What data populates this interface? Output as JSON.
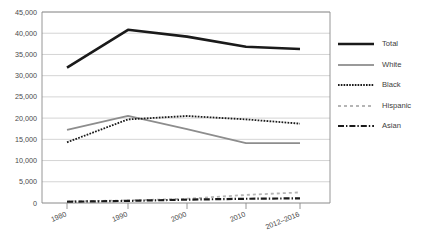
{
  "chart_data": {
    "type": "line",
    "title": "",
    "xlabel": "",
    "ylabel": "",
    "x": [
      "1980",
      "1990",
      "2000",
      "2010",
      "2012–2016"
    ],
    "categories": [
      "1980",
      "1990",
      "2000",
      "2010",
      "2012–2016"
    ],
    "ylim": [
      0,
      45000
    ],
    "ytick_values": [
      0,
      5000,
      10000,
      15000,
      20000,
      25000,
      30000,
      35000,
      40000,
      45000
    ],
    "ytick_labels": [
      "0",
      "5,000",
      "10,000",
      "15,000",
      "20,000",
      "25,000",
      "30,000",
      "35,000",
      "40,000",
      "45,000"
    ],
    "grid": "horizontal",
    "legend_position": "right",
    "series": [
      {
        "name": "Total",
        "values": [
          31900,
          40800,
          39200,
          36800,
          36300
        ],
        "color": "#1a1a1a",
        "style": "solid",
        "width": 2.6
      },
      {
        "name": "White",
        "values": [
          17200,
          20500,
          17400,
          14100,
          14100
        ],
        "color": "#8d8d8d",
        "style": "solid",
        "width": 1.8
      },
      {
        "name": "Black",
        "values": [
          14300,
          19700,
          20500,
          19700,
          18700
        ],
        "color": "#1a1a1a",
        "style": "dotted",
        "width": 1.8
      },
      {
        "name": "Hispanic",
        "values": [
          400,
          600,
          1000,
          1900,
          2500
        ],
        "color": "#b5b5b5",
        "style": "dashed",
        "width": 1.8
      },
      {
        "name": "Asian",
        "values": [
          300,
          500,
          800,
          1000,
          1100
        ],
        "color": "#1a1a1a",
        "style": "dashdot",
        "width": 2.2
      }
    ]
  },
  "legend": {
    "items": [
      {
        "label": "Total"
      },
      {
        "label": "White"
      },
      {
        "label": "Black"
      },
      {
        "label": "Hispanic"
      },
      {
        "label": "Asian"
      }
    ]
  }
}
